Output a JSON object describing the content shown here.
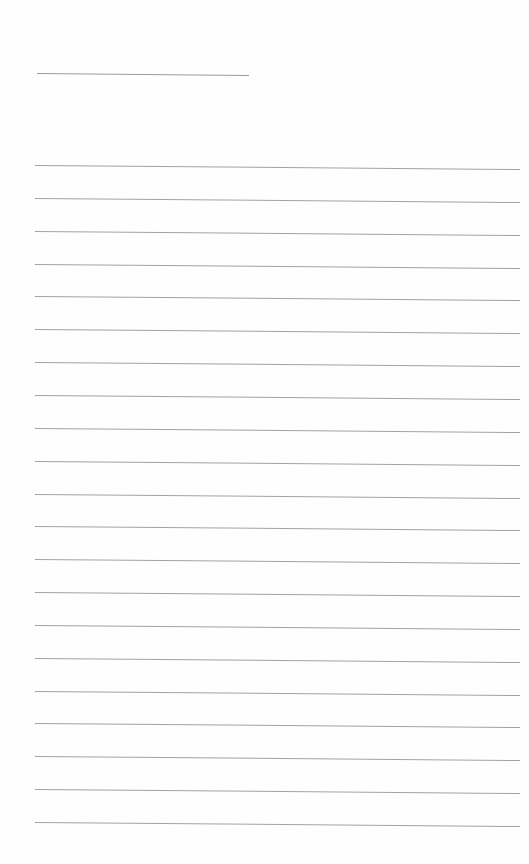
{
  "page": {
    "type": "lined-writing-paper",
    "background": "#fefefe",
    "line_color": "#a3a3a3",
    "title_line": {
      "x1": 37,
      "y1": 73,
      "x2": 249,
      "y2": 75
    },
    "ruled_lines": {
      "count": 21,
      "x_start": 35,
      "x_end": 520,
      "first_y": 165,
      "spacing": 32.85,
      "slope_px": 4
    }
  }
}
